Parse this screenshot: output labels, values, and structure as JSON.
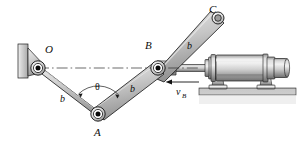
{
  "figure": {
    "type": "mechanism-kinematics-diagram",
    "labels": {
      "point_o": "O",
      "point_a": "A",
      "point_b": "B",
      "point_c": "C",
      "link_oa": "b",
      "link_ab": "b",
      "link_bc": "b",
      "angle": "θ",
      "velocity": "v",
      "velocity_sub": "B"
    },
    "colors": {
      "line": "#111111",
      "link_fill_light": "#d2d2d2",
      "link_fill_mid": "#b4b4b4",
      "link_fill_dark": "#8f8f8f",
      "wall_fill": "#c9c9c9",
      "ground_fill": "#b9b9b9",
      "cylinder_light": "#e3e3e3",
      "cylinder_mid": "#b0b0b0",
      "cylinder_dark": "#7d7d7d",
      "pin_black": "#0a0a0a",
      "background": "#ffffff"
    },
    "geometry": {
      "pivot_o": [
        38,
        68
      ],
      "joint_a": [
        98,
        114
      ],
      "joint_b": [
        158,
        68
      ],
      "pin_c": [
        218,
        18
      ],
      "centerline_from": [
        38,
        68
      ],
      "centerline_to": [
        196,
        68
      ],
      "arrow_tail": [
        196,
        82
      ],
      "arrow_head": [
        166,
        82
      ]
    }
  }
}
